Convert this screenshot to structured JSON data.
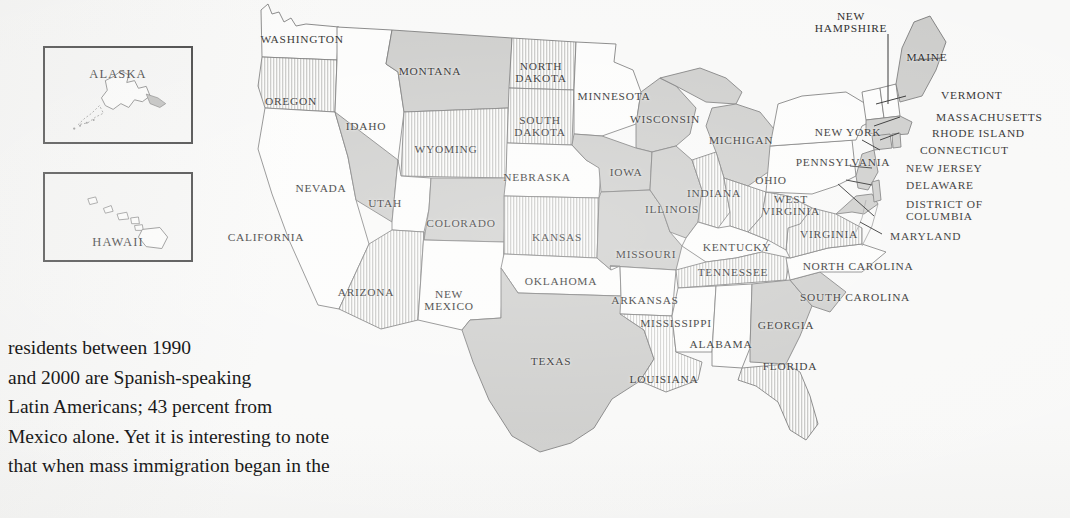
{
  "page": {
    "background_color": "#f8f8f7",
    "ink_color": "#1a1a1a",
    "map_outline_color": "#6e6e6e"
  },
  "insets": [
    {
      "name": "alaska",
      "label": "ALASKA"
    },
    {
      "name": "hawaii",
      "label": "HAWAII"
    }
  ],
  "map": {
    "title": "United States political map with state name labels",
    "fills": {
      "white": "#fcfcfb",
      "solid_gray": "#c9c9c7",
      "hatched_gray": "#dedede"
    },
    "states": [
      {
        "name": "WASHINGTON",
        "label": "WASHINGTON",
        "x": 302,
        "y": 39,
        "fill": "white"
      },
      {
        "name": "OREGON",
        "label": "OREGON",
        "x": 291,
        "y": 101,
        "fill": "hatched_gray"
      },
      {
        "name": "IDAHO",
        "label": "IDAHO",
        "x": 366,
        "y": 126,
        "fill": "white"
      },
      {
        "name": "MONTANA",
        "label": "MONTANA",
        "x": 430,
        "y": 71,
        "fill": "solid_gray"
      },
      {
        "name": "WYOMING",
        "label": "WYOMING",
        "x": 446,
        "y": 149,
        "fill": "hatched_gray"
      },
      {
        "name": "NEVADA",
        "label": "NEVADA",
        "x": 321,
        "y": 188,
        "fill": "solid_gray"
      },
      {
        "name": "UTAH",
        "label": "UTAH",
        "x": 385,
        "y": 203,
        "fill": "white"
      },
      {
        "name": "CALIFORNIA",
        "label": "CALIFORNIA",
        "x": 266,
        "y": 237,
        "fill": "white"
      },
      {
        "name": "ARIZONA",
        "label": "ARIZONA",
        "x": 366,
        "y": 292,
        "fill": "hatched_gray"
      },
      {
        "name": "COLORADO",
        "label": "COLORADO",
        "x": 461,
        "y": 223,
        "fill": "solid_gray"
      },
      {
        "name": "NEW MEXICO",
        "label": "NEW\nMEXICO",
        "x": 449,
        "y": 300,
        "fill": "white"
      },
      {
        "name": "NORTH DAKOTA",
        "label": "NORTH\nDAKOTA",
        "x": 541,
        "y": 72,
        "fill": "hatched_gray"
      },
      {
        "name": "SOUTH DAKOTA",
        "label": "SOUTH\nDAKOTA",
        "x": 540,
        "y": 126,
        "fill": "hatched_gray"
      },
      {
        "name": "NEBRASKA",
        "label": "NEBRASKA",
        "x": 537,
        "y": 177,
        "fill": "white"
      },
      {
        "name": "KANSAS",
        "label": "KANSAS",
        "x": 557,
        "y": 237,
        "fill": "hatched_gray"
      },
      {
        "name": "OKLAHOMA",
        "label": "OKLAHOMA",
        "x": 561,
        "y": 281,
        "fill": "white"
      },
      {
        "name": "TEXAS",
        "label": "TEXAS",
        "x": 551,
        "y": 361,
        "fill": "solid_gray"
      },
      {
        "name": "MINNESOTA",
        "label": "MINNESOTA",
        "x": 614,
        "y": 96,
        "fill": "white"
      },
      {
        "name": "IOWA",
        "label": "IOWA",
        "x": 626,
        "y": 172,
        "fill": "solid_gray"
      },
      {
        "name": "MISSOURI",
        "label": "MISSOURI",
        "x": 646,
        "y": 254,
        "fill": "solid_gray"
      },
      {
        "name": "ARKANSAS",
        "label": "ARKANSAS",
        "x": 645,
        "y": 300,
        "fill": "white"
      },
      {
        "name": "LOUISIANA",
        "label": "LOUISIANA",
        "x": 664,
        "y": 379,
        "fill": "hatched_gray"
      },
      {
        "name": "WISCONSIN",
        "label": "WISCONSIN",
        "x": 665,
        "y": 119,
        "fill": "solid_gray"
      },
      {
        "name": "ILLINOIS",
        "label": "ILLINOIS",
        "x": 672,
        "y": 209,
        "fill": "solid_gray"
      },
      {
        "name": "MISSISSIPPI",
        "label": "MISSISSIPPI",
        "x": 676,
        "y": 323,
        "fill": "white"
      },
      {
        "name": "MICHIGAN",
        "label": "MICHIGAN",
        "x": 741,
        "y": 140,
        "fill": "solid_gray"
      },
      {
        "name": "INDIANA",
        "label": "INDIANA",
        "x": 714,
        "y": 193,
        "fill": "hatched_gray"
      },
      {
        "name": "KENTUCKY",
        "label": "KENTUCKY",
        "x": 737,
        "y": 247,
        "fill": "white"
      },
      {
        "name": "TENNESSEE",
        "label": "TENNESSEE",
        "x": 733,
        "y": 272,
        "fill": "hatched_gray"
      },
      {
        "name": "ALABAMA",
        "label": "ALABAMA",
        "x": 721,
        "y": 344,
        "fill": "white"
      },
      {
        "name": "OHIO",
        "label": "OHIO",
        "x": 771,
        "y": 180,
        "fill": "hatched_gray"
      },
      {
        "name": "WEST VIRGINIA",
        "label": "WEST\nVIRGINIA",
        "x": 791,
        "y": 205,
        "fill": "hatched_gray"
      },
      {
        "name": "VIRGINIA",
        "label": "VIRGINIA",
        "x": 829,
        "y": 234,
        "fill": "hatched_gray"
      },
      {
        "name": "NORTH CAROLINA",
        "label": "NORTH CAROLINA",
        "x": 858,
        "y": 266,
        "fill": "white"
      },
      {
        "name": "SOUTH CAROLINA",
        "label": "SOUTH CAROLINA",
        "x": 855,
        "y": 297,
        "fill": "solid_gray"
      },
      {
        "name": "GEORGIA",
        "label": "GEORGIA",
        "x": 786,
        "y": 325,
        "fill": "solid_gray"
      },
      {
        "name": "FLORIDA",
        "label": "FLORIDA",
        "x": 790,
        "y": 366,
        "fill": "hatched_gray"
      },
      {
        "name": "PENNSYLVANIA",
        "label": "PENNSYLVANIA",
        "x": 843,
        "y": 162,
        "fill": "white"
      },
      {
        "name": "NEW YORK",
        "label": "NEW YORK",
        "x": 848,
        "y": 132,
        "fill": "white"
      },
      {
        "name": "NEW HAMPSHIRE",
        "label": "NEW\nHAMPSHIRE",
        "x": 851,
        "y": 22,
        "fill": "white"
      },
      {
        "name": "MAINE",
        "label": "MAINE",
        "x": 927,
        "y": 57,
        "fill": "solid_gray"
      }
    ],
    "callout_labels": [
      {
        "name": "VERMONT",
        "label": "VERMONT",
        "x": 941,
        "y": 95
      },
      {
        "name": "MASSACHUSETTS",
        "label": "MASSACHUSETTS",
        "x": 936,
        "y": 117
      },
      {
        "name": "RHODE ISLAND",
        "label": "RHODE ISLAND",
        "x": 932,
        "y": 133
      },
      {
        "name": "CONNECTICUT",
        "label": "CONNECTICUT",
        "x": 920,
        "y": 150
      },
      {
        "name": "NEW JERSEY",
        "label": "NEW JERSEY",
        "x": 906,
        "y": 168
      },
      {
        "name": "DELAWARE",
        "label": "DELAWARE",
        "x": 906,
        "y": 185
      },
      {
        "name": "DISTRICT OF COLUMBIA",
        "label": "DISTRICT OF\nCOLUMBIA",
        "x": 906,
        "y": 210
      },
      {
        "name": "MARYLAND",
        "label": "MARYLAND",
        "x": 890,
        "y": 236
      }
    ]
  },
  "body_text": {
    "lines": [
      "residents between 1990",
      "and 2000 are Spanish-speaking",
      "Latin Americans; 43 percent from",
      "Mexico alone. Yet it is interesting to note",
      "that when mass immigration began in the"
    ]
  }
}
